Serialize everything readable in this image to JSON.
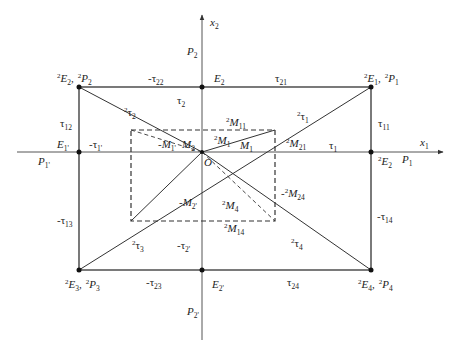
{
  "diagram": {
    "title": "",
    "colors": {
      "line": "#333333",
      "axis": "#555555",
      "dash": "#333333",
      "background": "#ffffff"
    },
    "origin": {
      "x": 202,
      "y": 152,
      "label": "O"
    },
    "axes": {
      "x": {
        "from": 17,
        "to": 443,
        "y": 152,
        "label": "x",
        "sub": "1"
      },
      "y": {
        "from": 340,
        "to": 15,
        "x": 202,
        "label": "x",
        "sub": "2"
      }
    },
    "outer_rect": {
      "left": 79,
      "top": 87,
      "right": 371,
      "bottom": 270
    },
    "dashed_rect": {
      "left": 131,
      "top": 130,
      "right": 275,
      "bottom": 221
    },
    "points": [
      {
        "id": "2E2-2P2",
        "x": 79,
        "y": 87
      },
      {
        "id": "E2",
        "x": 202,
        "y": 87
      },
      {
        "id": "2E1-2P1",
        "x": 371,
        "y": 87
      },
      {
        "id": "E1p",
        "x": 79,
        "y": 152
      },
      {
        "id": "2E2-right",
        "x": 371,
        "y": 152
      },
      {
        "id": "2E3-2P3",
        "x": 79,
        "y": 270
      },
      {
        "id": "E2p",
        "x": 202,
        "y": 270
      },
      {
        "id": "2E4-2P4",
        "x": 371,
        "y": 270
      }
    ],
    "labels": {
      "x2_axis": {
        "main": "x",
        "sub": "2"
      },
      "x1_axis": {
        "main": "x",
        "sub": "1"
      },
      "P2_top": {
        "main": "P",
        "sub": "2"
      },
      "P2p_bottom": {
        "main": "P",
        "sub": "2'"
      },
      "P1_right": {
        "main": "P",
        "sub": "1"
      },
      "P1p_left": {
        "main": "P",
        "sub": "1'"
      },
      "corner_tl": {
        "sup1": "2",
        "main1": "E",
        "sub1": "2",
        "sep": ",",
        "sup2": "2",
        "main2": "P",
        "sub2": "2"
      },
      "corner_tr": {
        "sup1": "2",
        "main1": "E",
        "sub1": "1",
        "sep": ",",
        "sup2": "2",
        "main2": "P",
        "sub2": "1"
      },
      "corner_bl": {
        "sup1": "2",
        "main1": "E",
        "sub1": "3",
        "sep": ",",
        "sup2": "2",
        "main2": "P",
        "sub2": "3"
      },
      "corner_br": {
        "sup1": "2",
        "main1": "E",
        "sub1": "4",
        "sep": ",",
        "sup2": "2",
        "main2": "P",
        "sub2": "4"
      },
      "E2_top": {
        "main": "E",
        "sub": "2"
      },
      "E2p_bottom": {
        "main": "E",
        "sub": "2'"
      },
      "E1p_left": {
        "main": "E",
        "sub": "1'"
      },
      "2E2_right": {
        "sup": "2",
        "main": "E",
        "sub": "2"
      },
      "tau22": {
        "prefix": "-",
        "main": "τ",
        "sub": "22"
      },
      "tau21": {
        "prefix": "",
        "main": "τ",
        "sub": "21"
      },
      "tau23": {
        "prefix": "-",
        "main": "τ",
        "sub": "23"
      },
      "tau24": {
        "prefix": "",
        "main": "τ",
        "sub": "24"
      },
      "tau12": {
        "prefix": "",
        "main": "τ",
        "sub": "12"
      },
      "tau11": {
        "prefix": "",
        "main": "τ",
        "sub": "11"
      },
      "tau13": {
        "prefix": "-",
        "main": "τ",
        "sub": "13"
      },
      "tau14": {
        "prefix": "-",
        "main": "τ",
        "sub": "14"
      },
      "tau2": {
        "prefix": "",
        "main": "τ",
        "sub": "2"
      },
      "tau1": {
        "prefix": "",
        "main": "τ",
        "sub": "1"
      },
      "tau1p": {
        "prefix": "-",
        "main": "τ",
        "sub": "1'"
      },
      "tau2p": {
        "prefix": "-",
        "main": "τ",
        "sub": "2'"
      },
      "2tau1": {
        "sup": "2",
        "main": "τ",
        "sub": "1"
      },
      "2tau2": {
        "sup": "2",
        "main": "τ",
        "sub": "2"
      },
      "2tau3": {
        "sup": "2",
        "main": "τ",
        "sub": "3"
      },
      "2tau4": {
        "sup": "2",
        "main": "τ",
        "sub": "4"
      },
      "M2": {
        "prefix": "",
        "main": "M",
        "sub": "2"
      },
      "M1": {
        "prefix": "",
        "main": "M",
        "sub": "1"
      },
      "M1p": {
        "prefix": "-",
        "main": "M",
        "sub": "1'"
      },
      "M2p": {
        "prefix": "-",
        "main": "M",
        "sub": "2'"
      },
      "2M1": {
        "sup": "2",
        "main": "M",
        "sub": "1"
      },
      "2M11": {
        "sup": "2",
        "main": "M",
        "sub": "11"
      },
      "2M21": {
        "sup": "2",
        "main": "M",
        "sub": "21"
      },
      "2M24": {
        "prefix": "-",
        "sup": "2",
        "main": "M",
        "sub": "24"
      },
      "2M4": {
        "sup": "2",
        "main": "M",
        "sub": "4"
      },
      "2M14": {
        "sup": "2",
        "main": "M",
        "sub": "14"
      },
      "origin": {
        "main": "O"
      }
    }
  }
}
